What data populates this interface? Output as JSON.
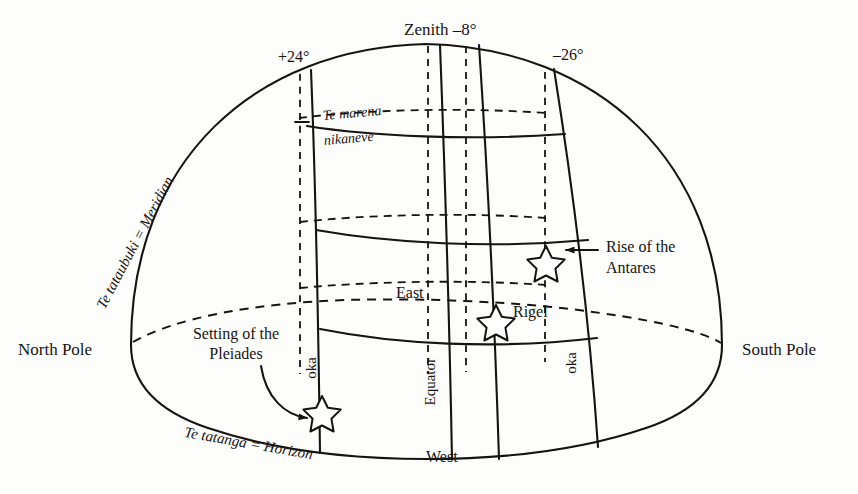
{
  "figure": {
    "type": "celestial-sphere-diagram",
    "background_color": "#fdfdfb",
    "ink_color": "#161412"
  },
  "labels": {
    "zenith": "Zenith –8°",
    "plus24": "+24°",
    "minus26": "–26°",
    "meridian": "Te tataubuki = Meridian",
    "horizon": "Te tatanga = Horizon",
    "marena_line1": "Te marena",
    "marena_line2": "nikaneve",
    "north_pole": "North Pole",
    "south_pole": "South Pole",
    "east": "East",
    "west": "West",
    "equator": "Equator",
    "oka_left": "oka",
    "oka_right": "oka",
    "setting_pleiades_line1": "Setting of the",
    "setting_pleiades_line2": "Pleiades",
    "rise_antares_line1": "Rise of the",
    "rise_antares_line2": "Antares",
    "rigel": "Rigel"
  },
  "stars": [
    {
      "name": "pleiades-star",
      "x": 322,
      "y": 411,
      "label": "Setting of the Pleiades"
    },
    {
      "name": "rigel-star",
      "x": 496,
      "y": 320,
      "label": "Rigel"
    },
    {
      "name": "antares-star",
      "x": 546,
      "y": 261,
      "label": "Rise of the Antares"
    }
  ],
  "declination_marks": [
    {
      "value": "+24°",
      "x": 299,
      "y": 61
    },
    {
      "value": "–8°",
      "x": 478,
      "y": 35
    },
    {
      "value": "–26°",
      "x": 574,
      "y": 59
    }
  ]
}
